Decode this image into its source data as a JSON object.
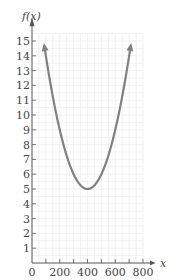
{
  "chart_data": {
    "type": "line",
    "title": "",
    "xlabel": "x",
    "ylabel": "f(x)",
    "xlim": [
      0,
      800
    ],
    "ylim": [
      0,
      15
    ],
    "grid": true,
    "x_ticks": [
      100,
      200,
      300,
      400,
      500,
      600,
      700,
      800
    ],
    "x_tick_labels": [
      "0",
      "200",
      "400",
      "600",
      "800"
    ],
    "x_tick_label_values": [
      0,
      200,
      400,
      600,
      800
    ],
    "y_ticks": [
      1,
      2,
      3,
      4,
      5,
      6,
      7,
      8,
      9,
      10,
      11,
      12,
      13,
      14,
      15
    ],
    "y_tick_labels": [
      "1",
      "2",
      "3",
      "4",
      "5",
      "6",
      "7",
      "8",
      "9",
      "10",
      "11",
      "12",
      "13",
      "14",
      "15"
    ],
    "series": [
      {
        "name": "f(x)",
        "shape": "parabola opening upward with arrows at both ends",
        "vertex": [
          400,
          5
        ],
        "x": [
          90,
          100,
          150,
          200,
          250,
          300,
          350,
          400,
          450,
          500,
          550,
          600,
          650,
          700,
          710
        ],
        "values": [
          14.6,
          14.0,
          11.3,
          9.0,
          7.2,
          6.0,
          5.3,
          5.0,
          5.3,
          6.0,
          7.2,
          9.0,
          11.3,
          14.0,
          14.6
        ],
        "color": "#808080"
      }
    ],
    "legend": null
  },
  "colors": {
    "curve": "#808080",
    "axis": "#555555",
    "grid": "#e8e8e8"
  }
}
